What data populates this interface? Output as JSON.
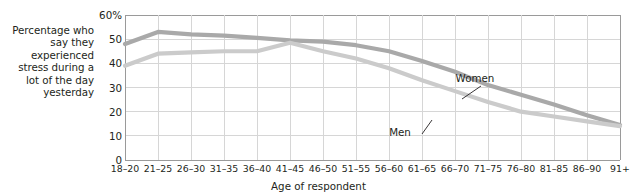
{
  "chart_data": {
    "type": "line",
    "title": "",
    "ylabel": "Percentage who say they experienced stress during a lot of the day yesterday",
    "xlabel": "Age of respondent",
    "categories": [
      "18–20",
      "21–25",
      "26–30",
      "31–35",
      "36–40",
      "41–45",
      "46–50",
      "51–55",
      "56–60",
      "61–65",
      "66–70",
      "71–75",
      "76–80",
      "81–85",
      "86–90",
      "91+"
    ],
    "ylim": [
      0,
      60
    ],
    "yticks": [
      0,
      10,
      20,
      30,
      40,
      50,
      60
    ],
    "ytick_labels": [
      "0",
      "10",
      "20",
      "30",
      "40",
      "50",
      "60%"
    ],
    "grid": true,
    "legend_position": "inline-annotation",
    "series": [
      {
        "name": "Women",
        "color": "#a9a9a9",
        "values": [
          48,
          53,
          52,
          51.5,
          50.5,
          49.5,
          49,
          47.5,
          45,
          41,
          36.5,
          31,
          27,
          23,
          18.5,
          14.5
        ]
      },
      {
        "name": "Men",
        "color": "#cbcbcb",
        "values": [
          39,
          44,
          44.5,
          45,
          45,
          48.5,
          45,
          42,
          38,
          33,
          28.5,
          24,
          20,
          18,
          16,
          14
        ]
      }
    ],
    "annotations": [
      {
        "text": "Women",
        "series": "Women",
        "label_x": 475,
        "label_y": 82,
        "point_x": 462,
        "point_y": 99
      },
      {
        "text": "Men",
        "series": "Men",
        "label_x": 400,
        "label_y": 136,
        "point_x": 432,
        "point_y": 120
      }
    ]
  }
}
